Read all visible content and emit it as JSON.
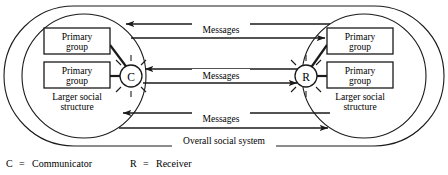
{
  "figure": {
    "type": "communication-model-diagram",
    "outer_label": "Overall social system",
    "sides": {
      "left": {
        "node_label": "C",
        "node_meaning": "Communicator",
        "structure_label_line1": "Larger social",
        "structure_label_line2": "structure",
        "groups": [
          {
            "line1": "Primary",
            "line2": "group"
          },
          {
            "line1": "Primary",
            "line2": "group"
          }
        ]
      },
      "right": {
        "node_label": "R",
        "node_meaning": "Receiver",
        "structure_label_line1": "Larger social",
        "structure_label_line2": "structure",
        "groups": [
          {
            "line1": "Primary",
            "line2": "group"
          },
          {
            "line1": "Primary",
            "line2": "group"
          }
        ]
      }
    },
    "channels": [
      {
        "label": "Messages",
        "direction_upper": "left",
        "direction_lower": "right"
      },
      {
        "label": "Messages",
        "direction_upper": "left",
        "direction_lower": "right"
      },
      {
        "label": "Messages",
        "direction_upper": "left",
        "direction_lower": "right"
      }
    ],
    "legend": [
      {
        "symbol": "C",
        "equals": "=",
        "meaning": "Communicator"
      },
      {
        "symbol": "R",
        "equals": "=",
        "meaning": "Receiver"
      }
    ],
    "colors": {
      "ink": "#1a1a1a",
      "paper": "#ffffff"
    }
  }
}
